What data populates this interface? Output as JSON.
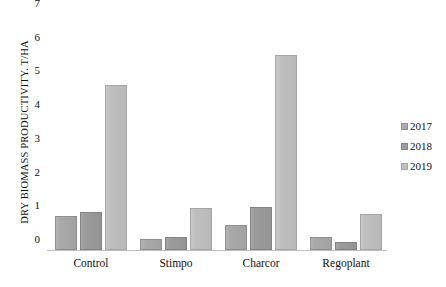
{
  "chart_data": {
    "type": "bar",
    "title": "",
    "xlabel": "",
    "ylabel": "DRY BIOMASS PRODUCTIVITY. T/HA",
    "ylim": [
      0,
      7
    ],
    "yticks": [
      0,
      1,
      2,
      3,
      4,
      5,
      6,
      7
    ],
    "ytick_labels": [
      "0",
      "1",
      "2",
      "3",
      "4",
      "5",
      "6",
      "7"
    ],
    "grid": false,
    "legend_position": "right",
    "categories": [
      "Control",
      "Stimpo",
      "Charcor",
      "Regoplant"
    ],
    "series": [
      {
        "name": "2017",
        "color": "#aaaaaa",
        "values": [
          1.02,
          0.34,
          0.74,
          0.38
        ]
      },
      {
        "name": "2018",
        "color": "#9c9c9c",
        "values": [
          1.13,
          0.4,
          1.27,
          0.25
        ]
      },
      {
        "name": "2019",
        "color": "#c0c0c0",
        "values": [
          4.89,
          1.26,
          5.78,
          1.06
        ]
      }
    ]
  },
  "legend": {
    "items": [
      {
        "label": "2017"
      },
      {
        "label": "2018"
      },
      {
        "label": "2019"
      }
    ]
  }
}
